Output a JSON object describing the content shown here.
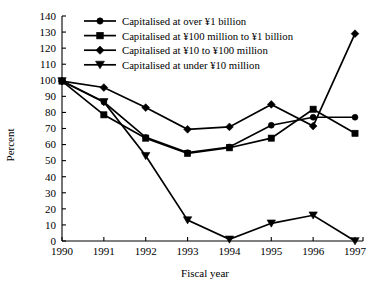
{
  "chart_data": {
    "type": "line",
    "title": "",
    "xlabel": "Fiscal year",
    "ylabel": "Percent",
    "categories": [
      "1990",
      "1991",
      "1992",
      "1993",
      "1994",
      "1995",
      "1996",
      "1997"
    ],
    "x": [
      1990,
      1991,
      1992,
      1993,
      1994,
      1995,
      1996,
      1997
    ],
    "ylim": [
      0,
      140
    ],
    "ytick_step": 10,
    "yticks": [
      0,
      10,
      20,
      30,
      40,
      50,
      60,
      70,
      80,
      90,
      100,
      110,
      120,
      130,
      140
    ],
    "grid": false,
    "legend_position": "top-center",
    "series": [
      {
        "name": "Capitalised at over ¥1 billion",
        "marker": "circle",
        "values": [
          99.5,
          86.5,
          64.5,
          55.0,
          58.5,
          72.0,
          77.0,
          77.0
        ]
      },
      {
        "name": "Capitalised at ¥100 million to ¥1 billion",
        "marker": "square",
        "values": [
          99.5,
          78.5,
          64.0,
          54.5,
          58.0,
          64.0,
          82.0,
          67.0
        ]
      },
      {
        "name": "Capitalised at ¥10 to ¥100 million",
        "marker": "diamond",
        "values": [
          99.5,
          95.5,
          83.0,
          69.5,
          71.0,
          85.0,
          71.5,
          129.0
        ]
      },
      {
        "name": "Capitalised at under ¥10 million",
        "marker": "triangle-down",
        "values": [
          99.5,
          86.5,
          53.0,
          13.0,
          1.0,
          11.0,
          16.0,
          0.0
        ]
      }
    ]
  }
}
